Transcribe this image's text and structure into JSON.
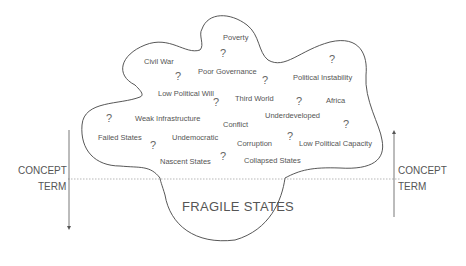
{
  "title": "FRAGILE STATES",
  "left_axis": {
    "upper": "CONCEPT",
    "lower": "TERM",
    "direction": "down"
  },
  "right_axis": {
    "upper": "CONCEPT",
    "lower": "TERM",
    "direction": "up"
  },
  "concepts": [
    {
      "label": "Poverty",
      "x": 223,
      "y": 33
    },
    {
      "label": "Civil War",
      "x": 144,
      "y": 57
    },
    {
      "label": "Poor Governance",
      "x": 198,
      "y": 67
    },
    {
      "label": "Political Instability",
      "x": 293,
      "y": 73
    },
    {
      "label": "Low Political Will",
      "x": 158,
      "y": 89
    },
    {
      "label": "Third World",
      "x": 235,
      "y": 94
    },
    {
      "label": "Africa",
      "x": 326,
      "y": 96
    },
    {
      "label": "Underdeveloped",
      "x": 265,
      "y": 111
    },
    {
      "label": "Weak Infrastructure",
      "x": 135,
      "y": 114
    },
    {
      "label": "Conflict",
      "x": 223,
      "y": 120
    },
    {
      "label": "Failed States",
      "x": 98,
      "y": 133
    },
    {
      "label": "Undemocratic",
      "x": 172,
      "y": 133
    },
    {
      "label": "Corruption",
      "x": 237,
      "y": 139
    },
    {
      "label": "Low Political Capacity",
      "x": 299,
      "y": 139
    },
    {
      "label": "Nascent States",
      "x": 160,
      "y": 157
    },
    {
      "label": "Collapsed States",
      "x": 244,
      "y": 156
    }
  ],
  "question_marks": [
    {
      "x": 220,
      "y": 47
    },
    {
      "x": 175,
      "y": 70
    },
    {
      "x": 262,
      "y": 74
    },
    {
      "x": 329,
      "y": 53
    },
    {
      "x": 213,
      "y": 96
    },
    {
      "x": 296,
      "y": 95
    },
    {
      "x": 106,
      "y": 112
    },
    {
      "x": 343,
      "y": 118
    },
    {
      "x": 150,
      "y": 139
    },
    {
      "x": 287,
      "y": 130
    },
    {
      "x": 220,
      "y": 150
    }
  ]
}
